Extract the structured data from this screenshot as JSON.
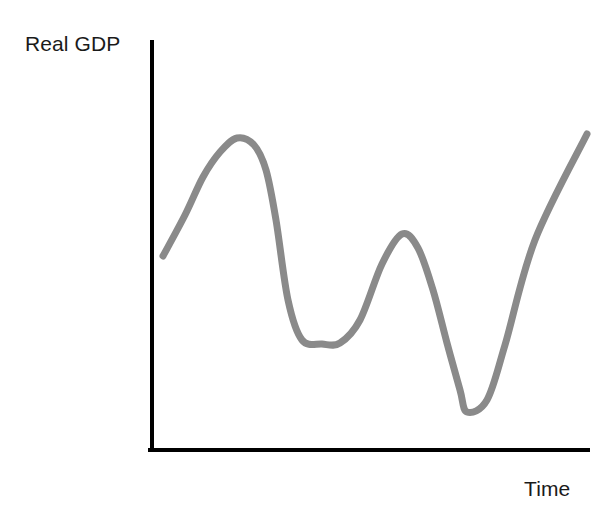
{
  "figure": {
    "width": 602,
    "height": 510,
    "background_color": "#ffffff"
  },
  "labels": {
    "ylabel": "Real GDP",
    "xlabel": "Time"
  },
  "style": {
    "axis_color": "#000000",
    "axis_width": 4,
    "curve_color": "#8a8a8a",
    "curve_width": 7,
    "label_color": "#1a1a1a",
    "label_font_size": 21
  },
  "axes": {
    "origin": {
      "x": 152,
      "y": 450
    },
    "y_axis_top": {
      "x": 152,
      "y": 42
    },
    "x_axis_right": {
      "x": 588,
      "y": 450
    },
    "ticks": [],
    "tick_labels": [],
    "grid": false
  },
  "chart_data": {
    "type": "line",
    "title": "",
    "subtitle": "",
    "xlabel": "Time",
    "ylabel": "Real GDP",
    "grid": false,
    "legend": null,
    "legend_position": "none",
    "xlim": [
      0,
      100
    ],
    "ylim": [
      0,
      100
    ],
    "axis_tick_labels": {
      "x": [],
      "y": []
    },
    "annotations": [],
    "series": [
      {
        "name": "Real GDP",
        "color": "#8a8a8a",
        "line_width": 7,
        "markers": false,
        "x": [
          0,
          5,
          10,
          15,
          20,
          25,
          29,
          33,
          38,
          43,
          48,
          52,
          57,
          62,
          66,
          70,
          74,
          78,
          82,
          86,
          90,
          94,
          97,
          100
        ],
        "y": [
          48,
          58,
          69,
          76,
          76,
          72,
          62,
          46,
          33,
          27,
          26,
          27,
          33,
          45,
          53,
          50,
          39,
          26,
          17,
          14,
          20,
          38,
          62,
          77
        ],
        "pixel_points": [
          [
            163,
            256
          ],
          [
            185,
            215
          ],
          [
            203,
            177
          ],
          [
            220,
            152
          ],
          [
            237,
            138
          ],
          [
            254,
            145
          ],
          [
            266,
            170
          ],
          [
            276,
            220
          ],
          [
            288,
            300
          ],
          [
            302,
            340
          ],
          [
            322,
            344
          ],
          [
            340,
            343
          ],
          [
            360,
            320
          ],
          [
            382,
            264
          ],
          [
            402,
            234
          ],
          [
            418,
            248
          ],
          [
            433,
            290
          ],
          [
            447,
            343
          ],
          [
            460,
            390
          ],
          [
            467,
            412
          ],
          [
            487,
            400
          ],
          [
            505,
            345
          ],
          [
            535,
            240
          ],
          [
            587,
            134
          ]
        ],
        "features": [
          {
            "label": "start",
            "pixel": [
              163,
              256
            ]
          },
          {
            "label": "peak-1",
            "pixel": [
              237,
              138
            ]
          },
          {
            "label": "trough-1",
            "pixel": [
              325,
              344
            ]
          },
          {
            "label": "peak-2",
            "pixel": [
              402,
              234
            ]
          },
          {
            "label": "trough-2",
            "pixel": [
              467,
              412
            ]
          },
          {
            "label": "end",
            "pixel": [
              587,
              134
            ]
          }
        ]
      }
    ]
  }
}
